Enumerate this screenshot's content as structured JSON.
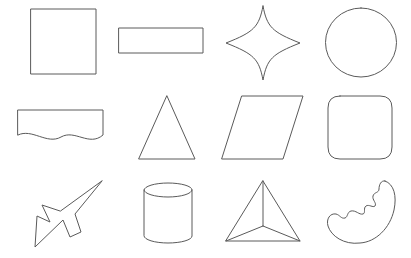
{
  "canvas": {
    "title": "Shape Sheet",
    "width": 411,
    "height": 258,
    "background_color": "#ffffff",
    "stroke_color": "#5a5a5a",
    "fill_color": "none",
    "stroke_width": 1,
    "grid_columns": 4,
    "grid_rows": 3
  },
  "shapes": [
    {
      "id": "square",
      "label": "Square",
      "row": 1,
      "column": 1,
      "geometry": "rect",
      "bbox": [
        31,
        9,
        65,
        65
      ],
      "path": "M31,9 L96,9 L96,74 L31,74 Z"
    },
    {
      "id": "rectangle",
      "label": "Rectangle",
      "row": 1,
      "column": 2,
      "geometry": "rect",
      "bbox": [
        119,
        28,
        84,
        25
      ],
      "path": "M119,28 L203,28 L203,53 L119,53 Z"
    },
    {
      "id": "four-pointed-star",
      "label": "Four-Pointed Star",
      "row": 1,
      "column": 3,
      "geometry": "concave-star",
      "bbox": [
        226,
        6,
        74,
        74
      ],
      "path": "M263,6 C267,27 272,32 300,43 C272,54 267,59 263,80 C259,59 254,54 226,43 C254,32 259,27 263,6 Z"
    },
    {
      "id": "circle",
      "label": "Circle",
      "row": 1,
      "column": 4,
      "geometry": "ellipse",
      "bbox": [
        326,
        8,
        71,
        69
      ],
      "path": "M361,8 A35.5,34.5 0 1,1 361,77 A35.5,34.5 0 1,1 361,8 Z"
    },
    {
      "id": "wave-rectangle",
      "label": "Wave Rectangle",
      "row": 2,
      "column": 1,
      "geometry": "wave-edge-rect",
      "bbox": [
        18,
        110,
        85,
        31
      ],
      "path": "M18,110 L103,110 L103,135 C89,147 75,129 61,137 C47,145 32,128 18,135 Z"
    },
    {
      "id": "triangle",
      "label": "Triangle",
      "row": 2,
      "column": 2,
      "geometry": "isosceles-triangle",
      "bbox": [
        139,
        96,
        56,
        63
      ],
      "path": "M167,96 L195,159 L139,159 Z"
    },
    {
      "id": "parallelogram",
      "label": "Parallelogram",
      "row": 2,
      "column": 3,
      "geometry": "parallelogram",
      "bbox": [
        222,
        96,
        81,
        63
      ],
      "path": "M242,96 L303,96 L283,159 L222,159 Z"
    },
    {
      "id": "rounded-rectangle",
      "label": "Rounded Rectangle",
      "row": 2,
      "column": 4,
      "geometry": "rounded-rect",
      "bbox": [
        328,
        96,
        64,
        63
      ],
      "path": "M340,96 L380,96 Q392,96 392,108 L392,147 Q392,159 380,159 L340,159 Q328,159 328,147 L328,108 Q328,96 340,96 Z"
    },
    {
      "id": "arrow-cursor",
      "label": "Arrow",
      "row": 3,
      "column": 1,
      "geometry": "arrow",
      "bbox": [
        35,
        181,
        67,
        66
      ],
      "path": "M102,181 L75,214 L81,232 L70,237 L63,220 L35,247 L37,216 L50,222 L42,205 L60,211 Z"
    },
    {
      "id": "cylinder",
      "label": "Cylinder",
      "row": 3,
      "column": 2,
      "geometry": "cylinder",
      "bbox": [
        144,
        183,
        48,
        60
      ],
      "path": "M144,190 A24,7 0 0,1 192,190 L192,236 A24,7 0 0,1 144,236 Z",
      "extra_path": "M144,190 A24,7 0 0,0 192,190"
    },
    {
      "id": "pyramid",
      "label": "Pyramid",
      "row": 3,
      "column": 3,
      "geometry": "tetrahedron-wireframe",
      "bbox": [
        226,
        181,
        74,
        62
      ],
      "path": "M263,181 L300,241 L226,241 Z",
      "extra_path": "M263,181 L263,226 M263,226 L226,241 M263,226 L300,241"
    },
    {
      "id": "crescent-blob",
      "label": "Crescent",
      "row": 3,
      "column": 4,
      "geometry": "jagged-crescent",
      "bbox": [
        328,
        180,
        68,
        64
      ],
      "path": "M385,181 C394,184 397,196 394,210 C390,228 376,242 360,243 C344,245 331,236 328,226 C326,219 330,213 336,214 C340,215 341,219 345,218 C348,217 347,212 351,211 C356,210 359,215 363,214 C366,213 363,208 366,206 C369,204 373,208 375,206 C377,203 372,200 373,196 C374,192 379,193 379,189 C379,185 381,180 385,181 Z"
    }
  ]
}
